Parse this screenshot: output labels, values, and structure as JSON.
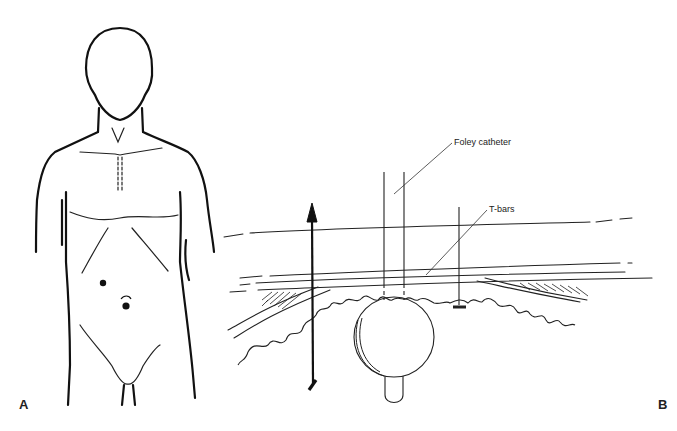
{
  "figure": {
    "panels": [
      {
        "id": "A",
        "label": "A",
        "description": "Front view of human torso showing two port sites on the abdomen"
      },
      {
        "id": "B",
        "label": "B",
        "description": "Cross-section of abdominal wall and stomach with Foley catheter and T-bars"
      }
    ],
    "annotations": {
      "foley": "Foley catheter",
      "tbars": "T-bars"
    }
  }
}
